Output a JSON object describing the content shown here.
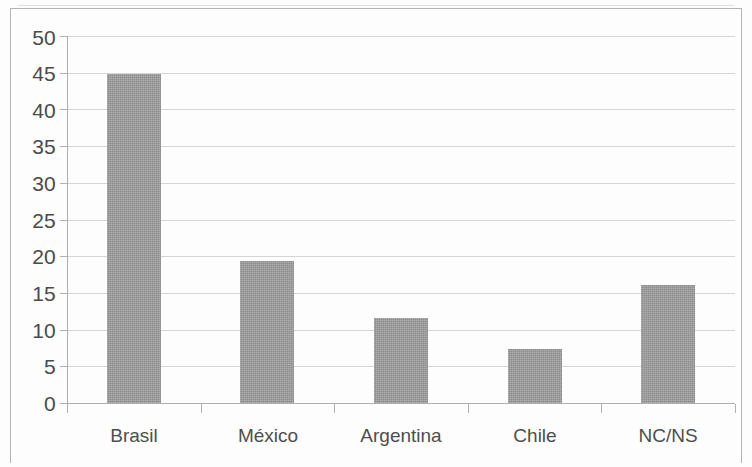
{
  "chart_data": {
    "type": "bar",
    "title": "",
    "subtitle": "",
    "xlabel": "",
    "ylabel": "",
    "categories": [
      "Brasil",
      "México",
      "Argentina",
      "Chile",
      "NC/NS"
    ],
    "values": [
      44.8,
      19.4,
      11.6,
      7.4,
      16.1
    ],
    "series": [
      {
        "name": "",
        "values": [
          44.8,
          19.4,
          11.6,
          7.4,
          16.1
        ]
      }
    ],
    "ylim": [
      0,
      50
    ],
    "ytick_step": 5,
    "ytick_labels": [
      "0",
      "5",
      "10",
      "15",
      "20",
      "25",
      "30",
      "35",
      "40",
      "45",
      "50"
    ],
    "ytick_values": [
      0,
      5,
      10,
      15,
      20,
      25,
      30,
      35,
      40,
      45,
      50
    ],
    "grid": true,
    "grid_axis": "y",
    "legend": false,
    "legend_position": "none",
    "annotations": [],
    "colors": {
      "bar_fill": "#9a9a9a",
      "gridline": "#d5d5d5",
      "axis_line": "#b0b0b0",
      "plot_background": "#fdfdfd",
      "frame_border": "#b3b3b3",
      "tick_label": "#4a4a4a",
      "category_label": "#4e4e4e"
    }
  }
}
